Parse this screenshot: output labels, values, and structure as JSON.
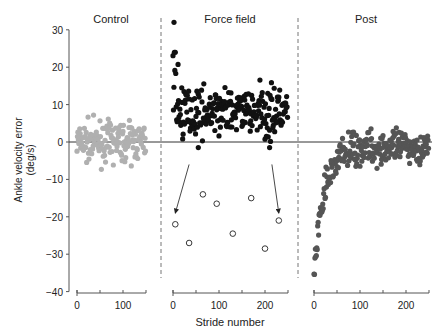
{
  "chart_data": {
    "type": "scatter",
    "title": "",
    "ylabel": "Ankle velocity error (deg/s)",
    "xlabel": "Stride number",
    "ylim": [
      -40,
      30
    ],
    "yticks": [
      30,
      20,
      10,
      0,
      -10,
      -20,
      -30,
      -40
    ],
    "grid": false,
    "legend": null,
    "panels": [
      {
        "name": "Control",
        "xlim": [
          0,
          150
        ],
        "xticks": [
          0,
          100
        ],
        "minor_xticks": [
          50,
          150
        ],
        "color": "#b0b0b0"
      },
      {
        "name": "Force field",
        "xlim": [
          0,
          250
        ],
        "xticks": [
          0,
          100,
          200
        ],
        "minor_xticks": [
          50,
          150,
          250
        ],
        "color": "#111111"
      },
      {
        "name": "Post",
        "xlim": [
          0,
          250
        ],
        "xticks": [
          0,
          100,
          200
        ],
        "minor_xticks": [
          50,
          150,
          250
        ],
        "color": "#555555"
      }
    ],
    "series": [
      {
        "name": "Control",
        "panel": 0,
        "marker": "filled",
        "description": "about 150 strides scattered around 0, range roughly -8 to +10"
      },
      {
        "name": "Force field",
        "panel": 1,
        "marker": "filled",
        "description": "about 250 strides scattered around +8, range roughly -2 to +32; early strides up to 20-32"
      },
      {
        "name": "Force field catch trials",
        "panel": 1,
        "marker": "open",
        "x": [
          5,
          35,
          65,
          95,
          130,
          170,
          200,
          230
        ],
        "y": [
          -22,
          -27,
          -14,
          -16.5,
          -24.5,
          -15,
          -28.5,
          -21
        ]
      },
      {
        "name": "Post",
        "panel": 2,
        "marker": "filled",
        "description": "starts near -35 at stride 0 and rises exponentially to about 0 by stride ~70, then scatters around -2 (range -15 to +5)"
      }
    ],
    "annotations": [
      {
        "type": "arrow",
        "from": [
          35,
          -6
        ],
        "to": [
          5,
          -19
        ],
        "panel": 1
      },
      {
        "type": "arrow",
        "from": [
          215,
          -6
        ],
        "to": [
          230,
          -19
        ],
        "panel": 1
      },
      {
        "type": "hline",
        "y": 0
      },
      {
        "type": "dashed-vline",
        "between": [
          "Control",
          "Force field"
        ]
      },
      {
        "type": "dashed-vline",
        "between": [
          "Force field",
          "Post"
        ]
      }
    ]
  },
  "labels": {
    "ylabel_line1": "Ankle velocity error",
    "ylabel_line2": "(deg/s)",
    "xlabel": "Stride number",
    "panel_titles": [
      "Control",
      "Force field",
      "Post"
    ]
  }
}
